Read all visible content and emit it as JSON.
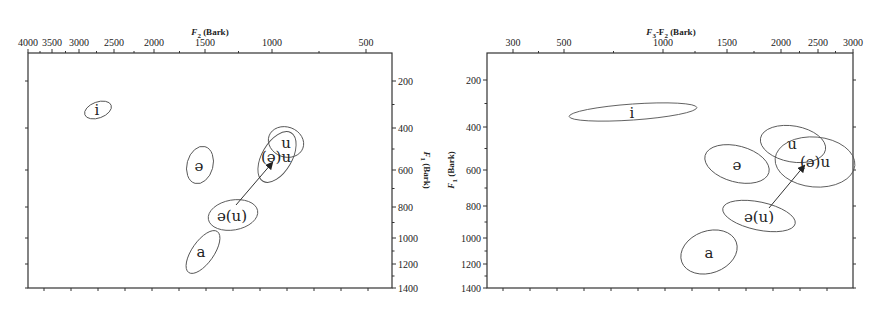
{
  "chart_data": [
    {
      "type": "scatter",
      "subtype": "vowel-ellipse-plot",
      "title": "",
      "xlabel": "F2 (Bark)",
      "ylabel": "F1 (Bark)",
      "xlabel_sub": "2",
      "ylabel_sub": "1",
      "x_axis_position": "top",
      "y_axis_position": "right",
      "x_scale": "bark (reversed)",
      "x_ticks": [
        "4000",
        "3500",
        "3000",
        "2500",
        "2000",
        "1500",
        "1000",
        "500"
      ],
      "y_ticks": [
        "200",
        "400",
        "600",
        "800",
        "1000",
        "1200",
        "1400"
      ],
      "ylim": [
        1400,
        100
      ],
      "grid": false,
      "series": [
        {
          "name": "i",
          "label": "i",
          "f2": 2800,
          "f1": 340
        },
        {
          "name": "ə",
          "label": "ə",
          "f2": 1500,
          "f1": 590
        },
        {
          "name": "u",
          "label": "u",
          "f2": 900,
          "f1": 460
        },
        {
          "name": "(ə)u",
          "label": "(ə)u",
          "f2": 950,
          "f1": 560
        },
        {
          "name": "ə(u)",
          "label": "ə(u)",
          "f2": 1250,
          "f1": 860
        },
        {
          "name": "a",
          "label": "a",
          "f2": 1500,
          "f1": 1110
        }
      ],
      "annotations": [
        {
          "type": "arrow",
          "from": "ə(u)",
          "to": "(ə)u"
        }
      ]
    },
    {
      "type": "scatter",
      "subtype": "vowel-ellipse-plot",
      "title": "",
      "xlabel": "F3-F2 (Bark)",
      "ylabel": "F1 (Bark)",
      "x_axis_position": "top",
      "y_axis_position": "left",
      "x_ticks": [
        "300",
        "500",
        "1000",
        "1500",
        "2000",
        "2500",
        "3000"
      ],
      "y_ticks": [
        "200",
        "400",
        "600",
        "800",
        "1000",
        "1200",
        "1400"
      ],
      "ylim": [
        1400,
        100
      ],
      "grid": false,
      "series": [
        {
          "name": "i",
          "label": "i",
          "f3_f2": 900,
          "f1": 330
        },
        {
          "name": "ə",
          "label": "ə",
          "f3_f2": 1450,
          "f1": 590
        },
        {
          "name": "u",
          "label": "u",
          "f3_f2": 1950,
          "f1": 480
        },
        {
          "name": "(ə)u",
          "label": "(ə)u",
          "f3_f2": 2300,
          "f1": 560
        },
        {
          "name": "ə(u)",
          "label": "ə(u)",
          "f3_f2": 1850,
          "f1": 880
        },
        {
          "name": "a",
          "label": "a",
          "f3_f2": 1300,
          "f1": 1150
        }
      ],
      "annotations": [
        {
          "type": "arrow",
          "from": "ə(u)",
          "to": "(ə)u"
        }
      ]
    }
  ],
  "left": {
    "x_title_main": "F",
    "x_title_sub": "2",
    "x_title_rest": " (Bark)",
    "y_title_main": "F",
    "y_title_sub": "1",
    "y_title_rest": " (Bark)",
    "x_ticks": [
      {
        "label": "4000",
        "x": 28
      },
      {
        "label": "3500",
        "x": 52
      },
      {
        "label": "3000",
        "x": 79
      },
      {
        "label": "2500",
        "x": 114
      },
      {
        "label": "2000",
        "x": 154
      },
      {
        "label": "1500",
        "x": 205
      },
      {
        "label": "1000",
        "x": 272
      },
      {
        "label": "500",
        "x": 366
      }
    ],
    "y_ticks": [
      {
        "label": "200",
        "y": 81
      },
      {
        "label": "400",
        "y": 128
      },
      {
        "label": "600",
        "y": 170
      },
      {
        "label": "800",
        "y": 207
      },
      {
        "label": "1000",
        "y": 238
      },
      {
        "label": "1200",
        "y": 264
      },
      {
        "label": "1400",
        "y": 288
      }
    ],
    "ellipses": [
      {
        "name": "i",
        "label": "i",
        "cx": 98,
        "cy": 110,
        "rx": 14,
        "ry": 8,
        "rot": -20,
        "lx": 97,
        "ly": 115
      },
      {
        "name": "schwa",
        "label": "ə",
        "cx": 200,
        "cy": 165,
        "rx": 13,
        "ry": 19,
        "rot": 15,
        "lx": 199,
        "ly": 171
      },
      {
        "name": "u",
        "label": "u",
        "cx": 286,
        "cy": 142,
        "rx": 18,
        "ry": 15,
        "rot": 20,
        "lx": 286,
        "ly": 148
      },
      {
        "name": "schwa-u",
        "label": "(ə)u",
        "cx": 277,
        "cy": 157,
        "rx": 15,
        "ry": 28,
        "rot": 30,
        "lx": 276,
        "ly": 162
      },
      {
        "name": "schwa-paren-u",
        "label": "ə(u)",
        "cx": 233,
        "cy": 215,
        "rx": 25,
        "ry": 15,
        "rot": -10,
        "lx": 232,
        "ly": 221
      },
      {
        "name": "a",
        "label": "a",
        "cx": 203,
        "cy": 252,
        "rx": 11,
        "ry": 25,
        "rot": 35,
        "lx": 201,
        "ly": 257
      }
    ],
    "arrow": {
      "x1": 236,
      "y1": 205,
      "x2": 272,
      "y2": 163
    }
  },
  "right": {
    "x_title_main": "F",
    "x_title_sub": "3",
    "x_title_mid": "-F",
    "x_title_sub2": "2",
    "x_title_rest": " (Bark)",
    "y_title_main": "F",
    "y_title_sub": "1",
    "y_title_rest": " (Bark)",
    "x_ticks": [
      {
        "label": "300",
        "x": 513
      },
      {
        "label": "500",
        "x": 564
      },
      {
        "label": "1000",
        "x": 663
      },
      {
        "label": "1500",
        "x": 727
      },
      {
        "label": "2000",
        "x": 781
      },
      {
        "label": "2500",
        "x": 818
      },
      {
        "label": "3000",
        "x": 853
      }
    ],
    "y_ticks": [
      {
        "label": "200",
        "y": 80
      },
      {
        "label": "400",
        "y": 127
      },
      {
        "label": "600",
        "y": 170
      },
      {
        "label": "800",
        "y": 206
      },
      {
        "label": "1000",
        "y": 238
      },
      {
        "label": "1200",
        "y": 264
      },
      {
        "label": "1400",
        "y": 288
      }
    ],
    "ellipses": [
      {
        "name": "i",
        "label": "i",
        "cx": 633,
        "cy": 112,
        "rx": 64,
        "ry": 8,
        "rot": -4,
        "lx": 632,
        "ly": 118
      },
      {
        "name": "schwa",
        "label": "ə",
        "cx": 737,
        "cy": 164,
        "rx": 33,
        "ry": 18,
        "rot": 15,
        "lx": 737,
        "ly": 170
      },
      {
        "name": "u",
        "label": "u",
        "cx": 793,
        "cy": 144,
        "rx": 33,
        "ry": 18,
        "rot": 10,
        "lx": 792,
        "ly": 149
      },
      {
        "name": "schwa-u",
        "label": "(ə)u",
        "cx": 815,
        "cy": 162,
        "rx": 40,
        "ry": 25,
        "rot": 5,
        "lx": 815,
        "ly": 167
      },
      {
        "name": "schwa-paren-u",
        "label": "ə(u)",
        "cx": 759,
        "cy": 216,
        "rx": 37,
        "ry": 14,
        "rot": 12,
        "lx": 759,
        "ly": 222
      },
      {
        "name": "a",
        "label": "a",
        "cx": 709,
        "cy": 252,
        "rx": 29,
        "ry": 21,
        "rot": -20,
        "lx": 709,
        "ly": 258
      }
    ],
    "arrow": {
      "x1": 769,
      "y1": 208,
      "x2": 804,
      "y2": 166
    }
  }
}
